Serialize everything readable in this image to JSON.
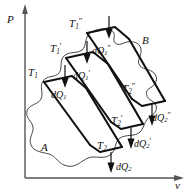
{
  "figure": {
    "type": "p-v-thermodynamic-diagram",
    "background_color": "#ffffff",
    "line_color": "#111111",
    "axes": {
      "y_label": "P",
      "x_label": "v",
      "y_label_full": "Pressure",
      "x_label_full": "specific volume"
    },
    "regions": [
      {
        "id": "A",
        "label": "A"
      },
      {
        "id": "B",
        "label": "B"
      }
    ],
    "isotherms_hot": [
      {
        "id": "T1",
        "base": "T",
        "sub": "1",
        "prime": ""
      },
      {
        "id": "T1p",
        "base": "T",
        "sub": "1",
        "prime": "′"
      },
      {
        "id": "T1pp",
        "base": "T",
        "sub": "1",
        "prime": "″"
      }
    ],
    "isotherms_cold": [
      {
        "id": "T2",
        "base": "T",
        "sub": "2",
        "prime": ""
      },
      {
        "id": "T2p",
        "base": "T",
        "sub": "2",
        "prime": "′"
      },
      {
        "id": "T2pp",
        "base": "T",
        "sub": "2",
        "prime": "″"
      }
    ],
    "heat_in": [
      {
        "id": "dQ1",
        "base": "dQ",
        "sub": "1",
        "prime": ""
      },
      {
        "id": "dQ1p",
        "base": "dQ",
        "sub": "1",
        "prime": "′"
      },
      {
        "id": "dQ1pp",
        "base": "dQ",
        "sub": "1",
        "prime": "″"
      }
    ],
    "heat_out": [
      {
        "id": "dQ2",
        "base": "dQ",
        "sub": "2",
        "prime": ""
      },
      {
        "id": "dQ2p",
        "base": "dQ",
        "sub": "2",
        "prime": "′"
      },
      {
        "id": "dQ2pp",
        "base": "dQ",
        "sub": "2",
        "prime": "″"
      }
    ]
  },
  "labels": {
    "axis_p": "P",
    "axis_v": "v",
    "region_a": "A",
    "region_b": "B",
    "t1": "T",
    "t1_sub": "1",
    "t1_prime": "",
    "t1p": "T",
    "t1p_sub": "1",
    "t1p_prime": "′",
    "t1pp": "T",
    "t1pp_sub": "1",
    "t1pp_prime": "″",
    "t2": "T",
    "t2_sub": "2",
    "t2_prime": "",
    "t2p": "T",
    "t2p_sub": "2",
    "t2p_prime": "′",
    "t2pp": "T",
    "t2pp_sub": "2",
    "t2pp_prime": "″",
    "dq1": "dQ",
    "dq1_sub": "1",
    "dq1_prime": "",
    "dq1p": "dQ",
    "dq1p_sub": "1",
    "dq1p_prime": "′",
    "dq1pp": "dQ",
    "dq1pp_sub": "1",
    "dq1pp_prime": "″",
    "dq2": "dQ",
    "dq2_sub": "2",
    "dq2_prime": "",
    "dq2p": "dQ",
    "dq2p_sub": "2",
    "dq2p_prime": "′",
    "dq2pp": "dQ",
    "dq2pp_sub": "2",
    "dq2pp_prime": "″"
  }
}
